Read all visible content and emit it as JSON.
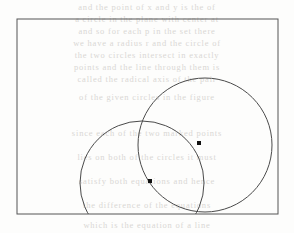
{
  "figure": {
    "caption": "",
    "background_color": "#fdfdfc",
    "stroke_color": "#4a4a4a",
    "dot_color": "#111111",
    "ghost_text_color": "#d9d7d4",
    "frame": {
      "name": "bounding-rectangle",
      "x": 17,
      "y": 19,
      "width": 261,
      "height": 195,
      "stroke_width": 1
    },
    "circles": [
      {
        "name": "right-circle",
        "cx": 205,
        "cy": 145,
        "r": 67,
        "stroke_width": 1
      },
      {
        "name": "left-circle",
        "cx": 142,
        "cy": 183,
        "r": 62,
        "stroke_width": 1
      }
    ],
    "intersection_points": [
      {
        "name": "upper-intersection-point",
        "x": 199,
        "y": 143,
        "size": 4
      },
      {
        "name": "lower-intersection-point",
        "x": 150,
        "y": 181,
        "size": 4
      }
    ]
  },
  "ghost_text": {
    "lines": [
      {
        "text": "and the point of x and y is the of",
        "top": 2
      },
      {
        "text": "a circle in the plane with center at",
        "top": 14
      },
      {
        "text": "and so for each p in the set there",
        "top": 26
      },
      {
        "text": "we have a radius r and the circle of",
        "top": 38
      },
      {
        "text": "the two circles intersect in exactly",
        "top": 50
      },
      {
        "text": "points and the line through them is",
        "top": 62
      },
      {
        "text": "called the radical axis of the pair",
        "top": 74
      },
      {
        "text": "of the given circles in the figure",
        "top": 92
      },
      {
        "text": "since each of the two marked points",
        "top": 128
      },
      {
        "text": "lies on both of the circles it must",
        "top": 152
      },
      {
        "text": "satisfy both equations and hence",
        "top": 176
      },
      {
        "text": "the difference of the equations",
        "top": 200
      },
      {
        "text": "which is the equation of a line",
        "top": 220
      }
    ]
  }
}
